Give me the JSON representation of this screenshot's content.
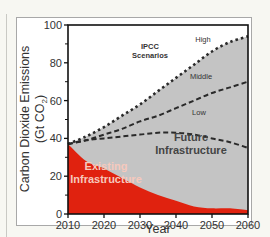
{
  "chart_data": {
    "type": "area",
    "title": "",
    "xlabel": "Year",
    "ylabel": "Carbon Dioxide Emissions (Gt CO2)",
    "ylabel_line1": "Carbon Dioxide Emissions",
    "ylabel_line2": "(Gt CO",
    "ylabel_sub": "2",
    "ylabel_close": ")",
    "xlim": [
      2010,
      2060
    ],
    "ylim": [
      0,
      100
    ],
    "x_ticks": [
      "2010",
      "2020",
      "2030",
      "2040",
      "2050",
      "2060"
    ],
    "y_ticks": [
      "0",
      "20",
      "40",
      "60",
      "80",
      "100"
    ],
    "x": [
      2010,
      2015,
      2020,
      2025,
      2030,
      2035,
      2040,
      2045,
      2050,
      2055,
      2060
    ],
    "series": [
      {
        "name": "High",
        "style": "dotted",
        "values": [
          37,
          41,
          46,
          52,
          58,
          65,
          72,
          79,
          86,
          91,
          94
        ]
      },
      {
        "name": "Middle",
        "style": "dashed",
        "values": [
          37,
          39,
          42,
          45,
          49,
          52,
          56,
          60,
          64,
          67,
          70
        ]
      },
      {
        "name": "Low",
        "style": "dashed",
        "values": [
          37,
          39,
          40,
          41,
          42,
          43,
          43,
          42,
          40,
          38,
          35
        ]
      },
      {
        "name": "Existing Infrastructure",
        "style": "filled-red",
        "values": [
          37,
          28,
          24,
          19,
          14,
          10,
          7,
          4,
          3,
          3,
          2
        ]
      }
    ],
    "annotations": {
      "scenarios_line1": "IPCC",
      "scenarios_line2": "Scenarios",
      "high": "High",
      "middle": "Middle",
      "low": "Low",
      "future_line1": "Future",
      "future_line2": "Infrastructure",
      "existing_line1": "Existing",
      "existing_line2": "Infrastructure"
    },
    "colors": {
      "existing": "#e0220f",
      "future": "#c4c4c4",
      "background": "#ffffff",
      "lines": "#2a2a2a"
    },
    "grid": false,
    "legend": "none"
  }
}
